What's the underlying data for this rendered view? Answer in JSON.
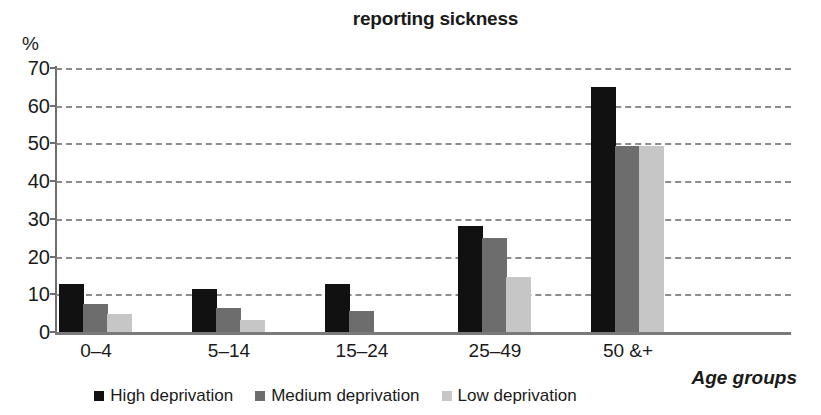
{
  "chart_data": {
    "type": "bar",
    "title": "reporting sickness",
    "xlabel": "Age groups",
    "ylabel": "%",
    "ylim": [
      0,
      70
    ],
    "yticks": [
      0,
      10,
      20,
      30,
      40,
      50,
      60,
      70
    ],
    "grid": true,
    "legend_position": "bottom",
    "categories": [
      "0–4",
      "5–14",
      "15–24",
      "25–49",
      "50 &+"
    ],
    "series": [
      {
        "name": "High deprivation",
        "color": "#111111",
        "values": [
          12.8,
          11.3,
          12.8,
          28.2,
          65.0
        ]
      },
      {
        "name": "Medium deprivation",
        "color": "#6d6d6d",
        "values": [
          7.4,
          6.4,
          5.6,
          24.8,
          49.3
        ]
      },
      {
        "name": "Low deprivation",
        "color": "#c6c6c6",
        "values": [
          4.8,
          3.1,
          0,
          14.5,
          49.3
        ]
      }
    ]
  },
  "axis": {
    "y_unit": "%",
    "tick_labels": [
      "70",
      "60",
      "50",
      "40",
      "30",
      "20",
      "10",
      "0"
    ],
    "x_axis_title": "Age groups"
  },
  "legend": {
    "items": [
      {
        "label": "High deprivation",
        "color": "#111111"
      },
      {
        "label": "Medium deprivation",
        "color": "#6d6d6d"
      },
      {
        "label": "Low deprivation",
        "color": "#c6c6c6"
      }
    ]
  }
}
